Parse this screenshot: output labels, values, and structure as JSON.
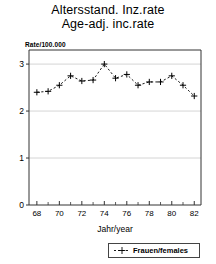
{
  "title": {
    "line1": "Altersstand. Inz.rate",
    "line2": "Age-adj. inc.rate"
  },
  "chart_data": {
    "type": "line",
    "subtitle": "",
    "xlabel": "Jahr/year",
    "ylabel": "Rate/100.000",
    "ylim": [
      0,
      3.3
    ],
    "xlim": [
      67.3,
      82.6
    ],
    "yticks": [
      "0",
      "1",
      "2",
      "3"
    ],
    "ytick_values": [
      0,
      1,
      2,
      3
    ],
    "xticks": [
      "68",
      "70",
      "72",
      "74",
      "76",
      "78",
      "80",
      "82"
    ],
    "xtick_values": [
      68,
      70,
      72,
      74,
      76,
      78,
      80,
      82
    ],
    "xminor_values": [
      69,
      71,
      73,
      75,
      77,
      79,
      81
    ],
    "grid": "horizontal",
    "legend_position": "bottom",
    "x": [
      68,
      69,
      70,
      71,
      72,
      73,
      74,
      75,
      76,
      77,
      78,
      79,
      80,
      81,
      82
    ],
    "series": [
      {
        "name": "Frauen/females",
        "marker": "+",
        "linestyle": "dashed",
        "color": "#000000",
        "values": [
          2.4,
          2.42,
          2.55,
          2.75,
          2.64,
          2.66,
          3.0,
          2.7,
          2.78,
          2.55,
          2.62,
          2.62,
          2.75,
          2.55,
          2.32
        ]
      }
    ]
  },
  "legend": {
    "entry": "Frauen/females"
  },
  "axis_label_x": "Jahr/year",
  "axis_label_y": "Rate/100.000"
}
